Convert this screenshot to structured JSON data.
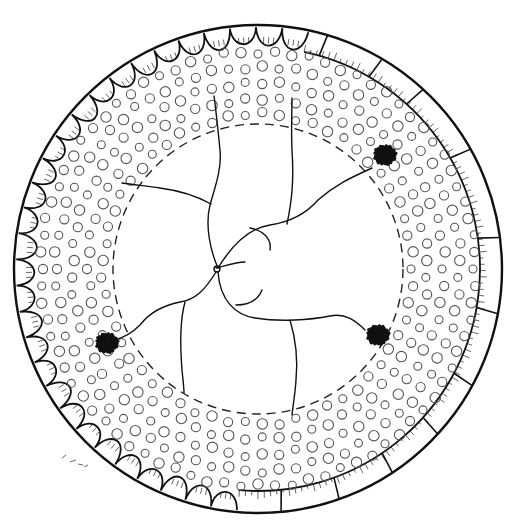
{
  "figure": {
    "title": "",
    "center": [
      258,
      269
    ],
    "outer_radius": 244,
    "pore_band_inner_radius": 150,
    "pore_band_outer_radius": 222,
    "dashed_circle_radius": 145,
    "colors": {
      "ink": "#111111",
      "pore": "#555555",
      "background": "#ffffff"
    },
    "dark_clusters": [
      {
        "name": "upper-right",
        "x": 385,
        "y": 155
      },
      {
        "name": "lower-left",
        "x": 107,
        "y": 343
      },
      {
        "name": "lower-right",
        "x": 378,
        "y": 335
      }
    ],
    "signature_text": "",
    "labels": []
  }
}
